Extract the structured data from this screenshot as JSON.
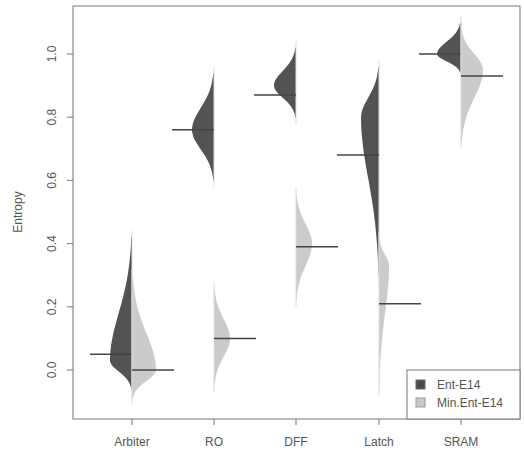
{
  "chart_data": {
    "type": "violin",
    "subtype": "split-violin (bean plot)",
    "title": "",
    "xlabel": "",
    "ylabel": "Entropy",
    "categories": [
      "Arbiter",
      "RO",
      "DFF",
      "Latch",
      "SRAM"
    ],
    "yticks": [
      "0.0",
      "0.2",
      "0.4",
      "0.6",
      "0.8",
      "1.0"
    ],
    "ytick_values": [
      0.0,
      0.2,
      0.4,
      0.6,
      0.8,
      1.0
    ],
    "ylim": [
      -0.14,
      1.12
    ],
    "grid": false,
    "legend_position": "bottom-right",
    "series": [
      {
        "name": "Ent-E14",
        "side": "left",
        "color": "#4a4a4a",
        "medians": [
          0.05,
          0.76,
          0.87,
          0.68,
          1.0
        ],
        "ranges": [
          [
            -0.06,
            0.42
          ],
          [
            0.6,
            0.94
          ],
          [
            0.8,
            1.02
          ],
          [
            0.3,
            0.96
          ],
          [
            0.94,
            1.1
          ]
        ],
        "modes": [
          0.03,
          0.76,
          0.9,
          0.8,
          1.0
        ],
        "widths": [
          0.55,
          0.55,
          0.55,
          0.45,
          0.6
        ]
      },
      {
        "name": "Min.Ent-E14",
        "side": "right",
        "color": "#c8c8c8",
        "medians": [
          0.0,
          0.1,
          0.39,
          0.21,
          0.93
        ],
        "ranges": [
          [
            -0.09,
            0.3
          ],
          [
            -0.05,
            0.26
          ],
          [
            0.22,
            0.56
          ],
          [
            -0.06,
            0.42
          ],
          [
            0.72,
            1.08
          ]
        ],
        "modes": [
          0.0,
          0.1,
          0.4,
          0.33,
          0.95
        ],
        "widths": [
          0.6,
          0.4,
          0.4,
          0.25,
          0.55
        ]
      }
    ]
  },
  "legend": {
    "items": [
      {
        "label": "Ent-E14",
        "color": "#4a4a4a"
      },
      {
        "label": "Min.Ent-E14",
        "color": "#c8c8c8"
      }
    ]
  }
}
